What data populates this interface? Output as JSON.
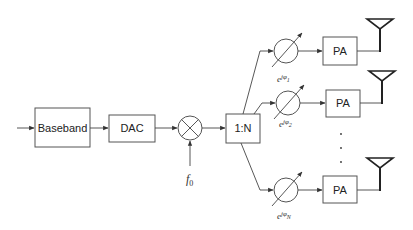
{
  "blocks": {
    "baseband": "Baseband",
    "dac": "DAC",
    "splitter": "1:N",
    "pa_label": "PA"
  },
  "mixer": {
    "lo_label": "f",
    "lo_subscript": "0"
  },
  "branches": [
    {
      "phase_label": "e",
      "phase_exp": "jφ",
      "phase_sub": "1"
    },
    {
      "phase_label": "e",
      "phase_exp": "jφ",
      "phase_sub": "2"
    },
    {
      "phase_label": "e",
      "phase_exp": "jφ",
      "phase_sub": "N"
    }
  ],
  "ellipsis": "⋮",
  "colors": {
    "stroke": "#444444",
    "text": "#222222",
    "background": "#ffffff"
  }
}
